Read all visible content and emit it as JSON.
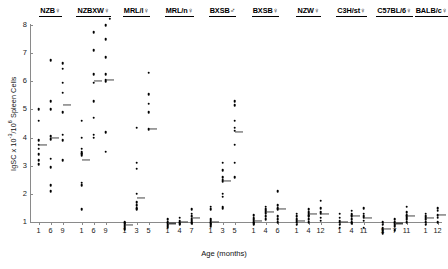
{
  "chart_data": {
    "type": "scatter",
    "title": "",
    "xlabel": "Age (months)",
    "ylabel": "IgSC x 10-3/106 Spleen Cells",
    "ylabel_parts": {
      "prefix": "IgSC x 10",
      "sup1": "-3",
      "mid": "/10",
      "sup2": "6",
      "suffix": " Spleen Cells"
    },
    "ylim": [
      0.4,
      8.3
    ],
    "yticks": [
      1,
      2,
      3,
      4,
      5,
      6,
      7,
      8
    ],
    "grid": false,
    "legend": "none",
    "marker": "filled-circle",
    "mean_indicator": "short horizontal bar",
    "groups": [
      {
        "label": "NZB",
        "sex": "female",
        "sex_symbol": "♀",
        "ages": [
          1,
          6,
          9
        ],
        "series": [
          {
            "age": 1,
            "values": [
              5.0,
              4.6,
              3.9,
              3.75,
              3.6,
              3.4,
              3.2,
              3.05
            ],
            "mean": 3.75
          },
          {
            "age": 6,
            "values": [
              6.75,
              5.3,
              5.0,
              4.05,
              3.95,
              3.25,
              2.95,
              2.3,
              2.1
            ],
            "mean": 4.0
          },
          {
            "age": 9,
            "values": [
              6.65,
              6.45,
              5.95,
              5.6,
              4.9,
              4.1,
              3.9,
              3.2
            ],
            "mean": 5.15
          }
        ]
      },
      {
        "label": "NZBXW",
        "sex": "female",
        "sex_symbol": "♀",
        "ages": [
          1,
          6,
          9
        ],
        "series": [
          {
            "age": 1,
            "values": [
              4.6,
              4.0,
              3.6,
              3.5,
              3.45,
              3.4,
              3.35,
              2.4,
              2.3,
              1.45
            ],
            "mean": 3.2
          },
          {
            "age": 6,
            "values": [
              7.75,
              7.1,
              6.25,
              5.95,
              5.3,
              4.7,
              4.1,
              4.0
            ],
            "mean": 6.0
          },
          {
            "age": 9,
            "values": [
              8.0,
              7.5,
              6.85,
              6.25,
              6.05,
              6.0,
              4.2,
              3.5
            ],
            "mean": 6.05
          }
        ]
      },
      {
        "label": "MRL/l",
        "sex": "female",
        "sex_symbol": "♀",
        "ages": [
          1,
          3,
          5
        ],
        "series": [
          {
            "age": 1,
            "values": [
              1.0,
              0.95,
              0.9,
              0.85,
              0.8,
              0.75
            ],
            "mean": 0.9
          },
          {
            "age": 3,
            "values": [
              4.35,
              3.1,
              2.9,
              2.0,
              1.7,
              1.6,
              1.5,
              1.45
            ],
            "mean": 1.85
          },
          {
            "age": 5,
            "values": [
              6.3,
              5.55,
              5.2,
              4.9,
              4.3
            ],
            "mean": 4.3
          }
        ]
      },
      {
        "label": "MRL/n",
        "sex": "female",
        "sex_symbol": "♀",
        "ages": [
          1,
          4,
          7
        ],
        "series": [
          {
            "age": 1,
            "values": [
              1.1,
              1.0,
              0.95,
              0.9,
              0.85,
              0.8
            ],
            "mean": 0.95
          },
          {
            "age": 4,
            "values": [
              1.15,
              1.05,
              1.0,
              0.95,
              0.9
            ],
            "mean": 1.0
          },
          {
            "age": 7,
            "values": [
              1.45,
              1.3,
              1.2,
              1.1,
              1.05,
              1.0,
              0.95
            ],
            "mean": 1.15
          }
        ]
      },
      {
        "label": "BXSB",
        "sex": "male",
        "sex_symbol": "♂",
        "ages": [
          1,
          3,
          5
        ],
        "series": [
          {
            "age": 1,
            "values": [
              1.55,
              1.45,
              1.1,
              1.05,
              1.0,
              0.95,
              0.9,
              0.85
            ],
            "mean": 1.0
          },
          {
            "age": 3,
            "values": [
              3.1,
              2.85,
              2.6,
              2.5,
              2.45,
              2.0,
              1.9,
              1.55,
              1.5
            ],
            "mean": 2.45
          },
          {
            "age": 5,
            "values": [
              5.3,
              5.15,
              4.6,
              4.35,
              4.25,
              3.75,
              3.1,
              2.6
            ],
            "mean": 4.2
          }
        ]
      },
      {
        "label": "BXSB",
        "sex": "female",
        "sex_symbol": "♀",
        "ages": [
          1,
          4,
          6
        ],
        "series": [
          {
            "age": 1,
            "values": [
              1.25,
              1.15,
              1.1,
              1.05,
              1.0,
              0.95,
              0.9
            ],
            "mean": 1.05
          },
          {
            "age": 4,
            "values": [
              1.55,
              1.45,
              1.4,
              1.35,
              1.3,
              1.2,
              1.1
            ],
            "mean": 1.35
          },
          {
            "age": 6,
            "values": [
              2.1,
              1.6,
              1.5,
              1.45,
              1.2,
              1.1,
              1.0
            ],
            "mean": 1.45
          }
        ]
      },
      {
        "label": "NZW",
        "sex": "female",
        "sex_symbol": "♀",
        "ages": [
          1,
          4,
          12
        ],
        "series": [
          {
            "age": 1,
            "values": [
              1.3,
              1.2,
              1.1,
              1.05,
              1.0,
              0.9
            ],
            "mean": 1.05
          },
          {
            "age": 4,
            "values": [
              1.45,
              1.35,
              1.3,
              1.25,
              1.2,
              1.1,
              1.0
            ],
            "mean": 1.3
          },
          {
            "age": 12,
            "values": [
              1.75,
              1.5,
              1.35,
              1.3,
              1.15,
              1.05
            ],
            "mean": 1.3
          }
        ]
      },
      {
        "label": "C3H/st",
        "sex": "female",
        "sex_symbol": "♀",
        "ages": [
          1,
          4,
          11
        ],
        "series": [
          {
            "age": 1,
            "values": [
              1.3,
              1.15,
              1.05,
              1.0,
              0.9,
              0.8
            ],
            "mean": 1.0
          },
          {
            "age": 4,
            "values": [
              1.4,
              1.3,
              1.25,
              1.2,
              1.1,
              1.0,
              0.95
            ],
            "mean": 1.2
          },
          {
            "age": 11,
            "values": [
              1.5,
              1.3,
              1.2,
              1.15,
              1.05,
              0.8
            ],
            "mean": 1.15
          }
        ]
      },
      {
        "label": "C57BL/6",
        "sex": "female",
        "sex_symbol": "♀",
        "ages": [
          1,
          7,
          11
        ],
        "series": [
          {
            "age": 1,
            "values": [
              1.0,
              0.9,
              0.8,
              0.75,
              0.7,
              0.65,
              0.6
            ],
            "mean": 0.75
          },
          {
            "age": 7,
            "values": [
              1.1,
              1.0,
              0.95,
              0.9,
              0.85,
              0.7
            ],
            "mean": 0.95
          },
          {
            "age": 11,
            "values": [
              1.55,
              1.35,
              1.25,
              1.2,
              1.15,
              1.1,
              1.0
            ],
            "mean": 1.2
          }
        ]
      },
      {
        "label": "BALB/c",
        "sex": "female",
        "sex_symbol": "♀",
        "ages": [
          1,
          12
        ],
        "series": [
          {
            "age": 1,
            "values": [
              1.3,
              1.2,
              1.15,
              1.1,
              1.0,
              0.9
            ],
            "mean": 1.15
          },
          {
            "age": 12,
            "values": [
              1.5,
              1.4,
              1.25,
              1.15,
              1.0
            ],
            "mean": 1.25
          }
        ]
      }
    ]
  }
}
